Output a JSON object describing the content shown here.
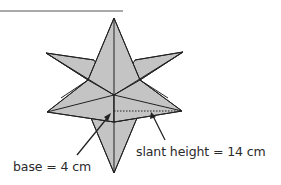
{
  "diagram": {
    "shape": "six-pointed star pyramid (star prism with triangular faces)",
    "colors": {
      "fill": "#c4c4c4",
      "stroke": "#222222",
      "background": "#ffffff"
    },
    "labels": {
      "base": "base = 4 cm",
      "slant_height": "slant height = 14 cm"
    },
    "measurements": {
      "base_cm": 4,
      "slant_height_cm": 14
    }
  }
}
